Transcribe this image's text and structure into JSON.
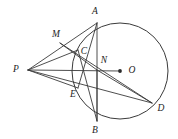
{
  "figure": {
    "kind": "euclidean-geometry-diagram",
    "background_color": "#ffffff",
    "stroke_color": "#3a3a3a",
    "label_color": "#1c1c1c",
    "canvas": {
      "width": 178,
      "height": 139
    },
    "circle": {
      "cx": 120,
      "cy": 71,
      "r": 48
    },
    "points": [
      {
        "id": "A",
        "label": "A",
        "x": 97,
        "y": 23,
        "label_x": 95,
        "label_y": 12,
        "dot": false
      },
      {
        "id": "M",
        "label": "M",
        "x": 60,
        "y": 43,
        "label_x": 56,
        "label_y": 35,
        "dot": false
      },
      {
        "id": "C",
        "label": "C",
        "x": 78,
        "y": 50,
        "label_x": 84,
        "label_y": 52,
        "dot": false
      },
      {
        "id": "N",
        "label": "N",
        "x": 97,
        "y": 70,
        "label_x": 104,
        "label_y": 61,
        "dot": false
      },
      {
        "id": "O",
        "label": "O",
        "x": 120,
        "y": 71,
        "label_x": 132,
        "label_y": 71,
        "dot": true
      },
      {
        "id": "P",
        "label": "P",
        "x": 28,
        "y": 70,
        "label_x": 16,
        "label_y": 70,
        "dot": false
      },
      {
        "id": "E",
        "label": "E",
        "x": 78,
        "y": 88,
        "label_x": 73,
        "label_y": 95,
        "dot": false
      },
      {
        "id": "B",
        "label": "B",
        "x": 97,
        "y": 121,
        "label_x": 95,
        "label_y": 131,
        "dot": false
      },
      {
        "id": "D",
        "label": "D",
        "x": 152,
        "y": 103,
        "label_x": 161,
        "label_y": 109,
        "dot": false
      }
    ],
    "segments": [
      {
        "id": "PA",
        "from": "P",
        "to": "A"
      },
      {
        "id": "PC",
        "from": "P",
        "to": "C"
      },
      {
        "id": "PO",
        "from": "P",
        "to": "O"
      },
      {
        "id": "PE",
        "from": "P",
        "to": "E"
      },
      {
        "id": "PD",
        "from": "P",
        "to": "D"
      },
      {
        "id": "AB",
        "from": "A",
        "to": "B"
      },
      {
        "id": "MN",
        "from": "M",
        "to": "N"
      },
      {
        "id": "MD",
        "from": "M",
        "to": "D"
      },
      {
        "id": "ND",
        "from": "N",
        "to": "D"
      },
      {
        "id": "NB",
        "from": "N",
        "to": "B"
      },
      {
        "id": "CB",
        "from": "C",
        "to": "B"
      },
      {
        "id": "AE",
        "from": "A",
        "to": "E"
      }
    ]
  }
}
